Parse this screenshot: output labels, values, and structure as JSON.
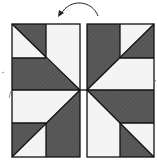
{
  "diagram": {
    "type": "quilt-block-flip",
    "colors": {
      "dark": "#555555",
      "light": "#f4f4f4",
      "stroke": "#111111",
      "arrow": "#222222"
    },
    "arrow": {
      "direction": "counterclockwise",
      "label": ""
    },
    "left_half": {
      "name": "original-half"
    },
    "right_half": {
      "name": "flipped-half"
    }
  }
}
